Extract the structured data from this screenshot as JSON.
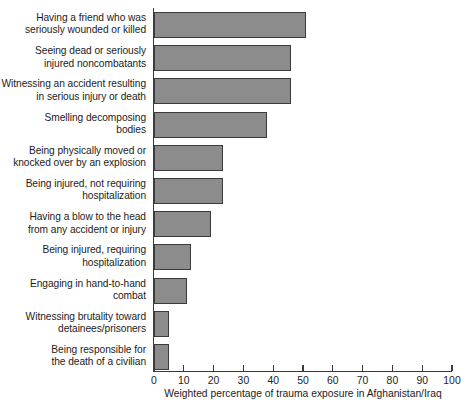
{
  "chart_data": {
    "type": "bar",
    "orientation": "horizontal",
    "title": "",
    "xlabel": "Weighted percentage of trauma exposure in Afghanistan/Iraq",
    "ylabel": "",
    "xlim": [
      0,
      100
    ],
    "xticks": [
      0,
      10,
      20,
      30,
      40,
      50,
      60,
      70,
      80,
      90,
      100
    ],
    "grid": false,
    "legend": null,
    "bar_color": "#8c8c8c",
    "bar_edge_color": "#3b3b3b",
    "categories": [
      "Having a friend who was seriously wounded or killed",
      "Seeing dead or seriously injured noncombatants",
      "Witnessing an accident resulting in serious injury or death",
      "Smelling decomposing bodies",
      "Being physically moved or knocked over by an explosion",
      "Being injured, not requiring hospitalization",
      "Having a blow to the head from any accident or injury",
      "Being injured, requiring hospitalization",
      "Engaging in hand-to-hand combat",
      "Witnessing brutality toward detainees/prisoners",
      "Being responsible for the death of a civilian"
    ],
    "category_lines": [
      [
        "Having a friend who was",
        "seriously wounded or killed"
      ],
      [
        "Seeing dead or seriously",
        "injured noncombatants"
      ],
      [
        "Witnessing an accident resulting",
        "in serious injury or death"
      ],
      [
        "Smelling decomposing",
        "bodies"
      ],
      [
        "Being physically moved or",
        "knocked over by an explosion"
      ],
      [
        "Being injured, not requiring",
        "hospitalization"
      ],
      [
        "Having a blow to the head",
        "from any accident or injury"
      ],
      [
        "Being injured, requiring",
        "hospitalization"
      ],
      [
        "Engaging in hand-to-hand",
        "combat"
      ],
      [
        "Witnessing brutality toward",
        "detainees/prisoners"
      ],
      [
        "Being responsible for",
        "the death of a civilian"
      ]
    ],
    "values": [
      51,
      46,
      46,
      38,
      23,
      23,
      19,
      12.5,
      11,
      5,
      5
    ]
  }
}
